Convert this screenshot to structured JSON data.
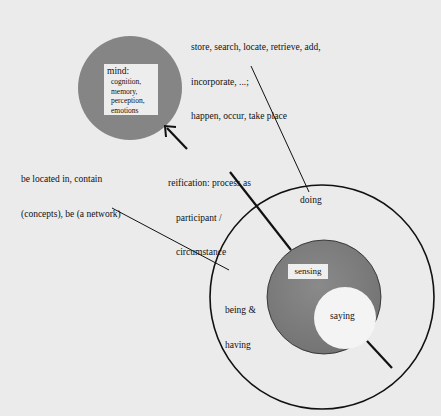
{
  "diagram": {
    "mind": {
      "title": "mind:",
      "items": [
        "cognition,",
        "memory,",
        "perception,",
        "emotions"
      ]
    },
    "annotations": {
      "top_right": {
        "line1": "store, search, locate, retrieve, add,",
        "line2": "incorporate, ...;",
        "line3": "happen, occur, take place"
      },
      "left": {
        "line1": "be located in, contain",
        "line2": "(concepts), be (a network)"
      },
      "reification": {
        "line1": "reification: process as",
        "line2": "participant /",
        "line3": "circumstance"
      }
    },
    "regions": {
      "doing": "doing",
      "being_having_line1": "being &",
      "being_having_line2": "having",
      "sensing": "sensing",
      "saying": "saying"
    },
    "colors": {
      "background": "#ebebeb",
      "mind_circle": "#858585",
      "sensing_circle": "#7d7d7d",
      "saying_circle": "#f4f4f4",
      "line": "#111111"
    }
  }
}
